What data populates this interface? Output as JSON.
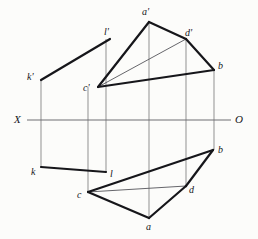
{
  "figure": {
    "background_color": "#fcfcfa",
    "ink_color": "#16161a",
    "thin_line_color": "#55555a",
    "projector_line_color": "#9a9a9a",
    "axis_color": "#6e6e73",
    "width": 258,
    "height": 239
  },
  "axis": {
    "name": "ground-line",
    "left_label": "X",
    "right_label": "O",
    "y": 120,
    "x_start": 27,
    "x_end": 231,
    "left_label_pos": {
      "x": 14,
      "y": 114
    },
    "right_label_pos": {
      "x": 235,
      "y": 114
    }
  },
  "points": {
    "a_prime": {
      "label": "a'",
      "x": 149,
      "y": 22,
      "label_pos": {
        "x": 142,
        "y": 7
      }
    },
    "b_prime": {
      "label": "b",
      "x": 214,
      "y": 70,
      "label_pos": {
        "x": 218,
        "y": 61
      }
    },
    "c_prime": {
      "label": "c'",
      "x": 98,
      "y": 87,
      "label_pos": {
        "x": 83,
        "y": 83
      }
    },
    "d_prime": {
      "label": "d'",
      "x": 186,
      "y": 39,
      "label_pos": {
        "x": 185,
        "y": 28
      }
    },
    "k_prime": {
      "label": "k'",
      "x": 41,
      "y": 80,
      "label_pos": {
        "x": 27,
        "y": 72
      }
    },
    "l_prime": {
      "label": "l'",
      "x": 110,
      "y": 39,
      "label_pos": {
        "x": 104,
        "y": 27
      }
    },
    "a": {
      "label": "a",
      "x": 149,
      "y": 218,
      "label_pos": {
        "x": 146,
        "y": 222
      }
    },
    "b": {
      "label": "b",
      "x": 213,
      "y": 150,
      "label_pos": {
        "x": 218,
        "y": 145
      }
    },
    "c": {
      "label": "c",
      "x": 88,
      "y": 192,
      "label_pos": {
        "x": 77,
        "y": 190
      }
    },
    "d": {
      "label": "d",
      "x": 186,
      "y": 186,
      "label_pos": {
        "x": 189,
        "y": 185
      }
    },
    "k": {
      "label": "k",
      "x": 41,
      "y": 167,
      "label_pos": {
        "x": 31,
        "y": 167
      }
    },
    "l": {
      "label": "l",
      "x": 106,
      "y": 172,
      "label_pos": {
        "x": 110,
        "y": 169
      }
    }
  },
  "edges_heavy": [
    {
      "name": "edge-cprime-aprime",
      "from": "c_prime",
      "to": "a_prime"
    },
    {
      "name": "edge-aprime-dprime",
      "from": "a_prime",
      "to": "d_prime"
    },
    {
      "name": "edge-dprime-bprime",
      "from": "d_prime",
      "to": "b_prime"
    },
    {
      "name": "edge-cprime-bprime",
      "from": "c_prime",
      "to": "b_prime"
    },
    {
      "name": "edge-kprime-lprime",
      "from": "k_prime",
      "to": "l_prime"
    },
    {
      "name": "edge-c-b",
      "from": "c",
      "to": "b"
    },
    {
      "name": "edge-b-d",
      "from": "b",
      "to": "d"
    },
    {
      "name": "edge-d-a",
      "from": "d",
      "to": "a"
    },
    {
      "name": "edge-a-c",
      "from": "a",
      "to": "c"
    },
    {
      "name": "edge-k-l",
      "from": "k",
      "to": "l"
    }
  ],
  "edges_thin": [
    {
      "name": "edge-cprime-dprime",
      "from": "c_prime",
      "to": "d_prime"
    },
    {
      "name": "edge-c-d",
      "from": "c",
      "to": "d"
    }
  ],
  "projectors": [
    {
      "name": "projector-k",
      "x": 41,
      "y1": 80,
      "y2": 167
    },
    {
      "name": "projector-c",
      "x": 88,
      "y1": 87,
      "y2": 192
    },
    {
      "name": "projector-l",
      "x": 106,
      "y1": 39,
      "y2": 172
    },
    {
      "name": "projector-a",
      "x": 149,
      "y1": 22,
      "y2": 218
    },
    {
      "name": "projector-d",
      "x": 186,
      "y1": 39,
      "y2": 186
    },
    {
      "name": "projector-b",
      "x": 214,
      "y1": 70,
      "y2": 150
    }
  ]
}
